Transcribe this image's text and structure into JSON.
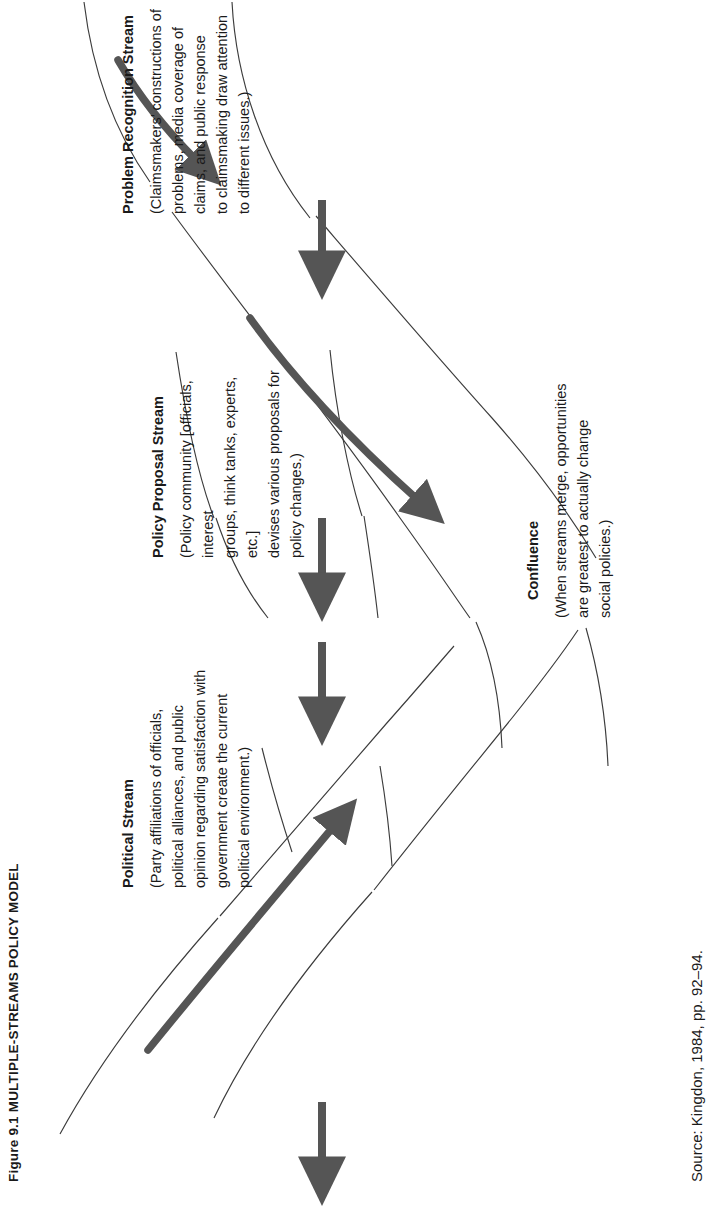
{
  "figure": {
    "title": "Figure 9.1  MULTIPLE-STREAMS POLICY MODEL",
    "source": "Source: Kingdon, 1984, pp. 92–94."
  },
  "blocks": [
    {
      "id": "problem-recognition-stream",
      "heading": "Problem Recognition Stream",
      "body": "(Claimsmakers’ constructions of\nproblems, media coverage of\nclaims, and public response\nto claimsmaking draw attention\nto different issues.)"
    },
    {
      "id": "policy-proposal-stream",
      "heading": "Policy Proposal Stream",
      "body": "(Policy community [officials, interest\ngroups, think tanks, experts, etc.]\ndevises various proposals for\npolicy changes.)"
    },
    {
      "id": "political-stream",
      "heading": "Political Stream",
      "body": "(Party affiliations of officials,\npolitical alliances, and public\nopinion regarding satisfaction with\ngovernment create the current\npolitical environment.)"
    },
    {
      "id": "confluence",
      "heading": "Confluence",
      "body": "(When streams merge, opportunities\nare greatest to actually change\nsocial policies.)"
    }
  ],
  "colors": {
    "ink": "#1a1a1a",
    "arrow": "#555555",
    "stream_line": "#3c3c3c",
    "background": "#ffffff"
  },
  "graphics": {
    "flow_arrow_count": 4,
    "stream_arrow_count": 3,
    "channel_count": 4
  }
}
